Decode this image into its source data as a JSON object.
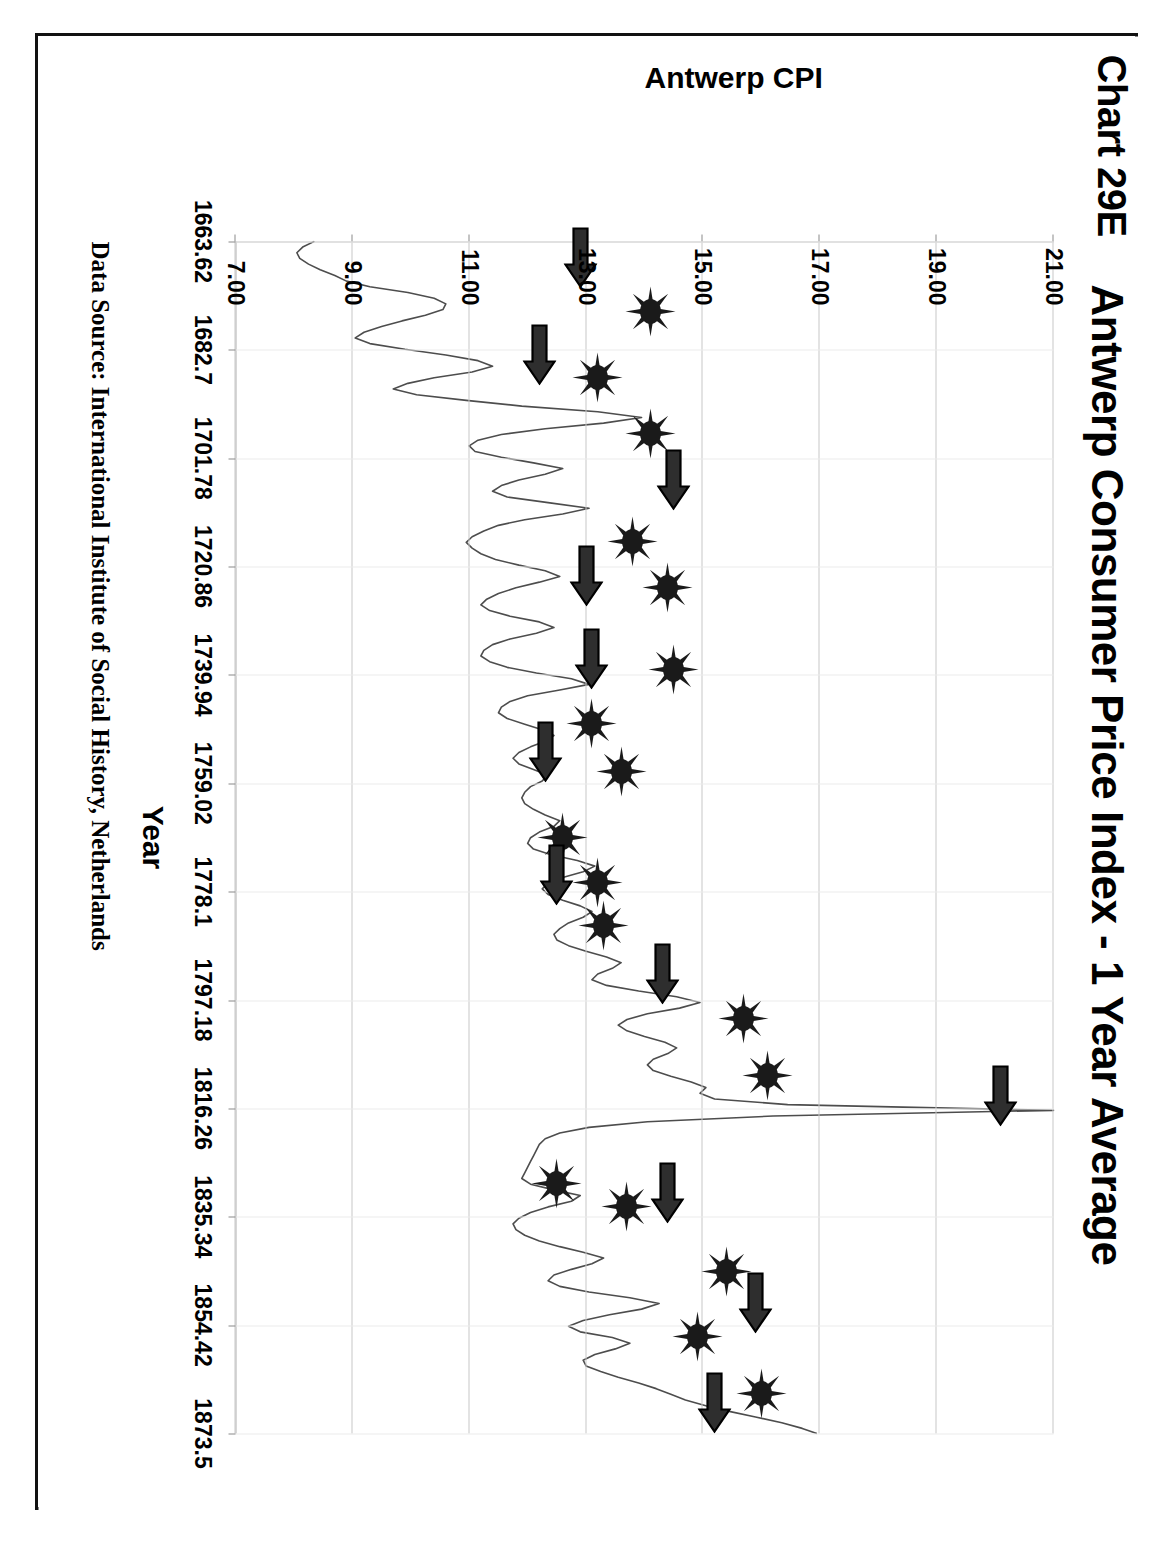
{
  "page": {
    "chart_number": "Chart 29E"
  },
  "chart_data": {
    "type": "line",
    "title": "Antwerp Consumer Price Index - 1 Year Average",
    "xlabel": "Year",
    "ylabel": "Antwerp CPI",
    "source_note": "Data Source:   International Institute of Social History, Netherlands",
    "grid": true,
    "legend": "none",
    "ylim": [
      7.0,
      21.0
    ],
    "xlim": [
      1663.62,
      1873.5
    ],
    "ytick_labels": [
      "21.00",
      "19.00",
      "17.00",
      "15.00",
      "13.00",
      "11.00",
      "9.00",
      "7.00"
    ],
    "ytick_values": [
      21.0,
      19.0,
      17.0,
      15.0,
      13.0,
      11.0,
      9.0,
      7.0
    ],
    "xtick_labels": [
      "1663.62",
      "1682.7",
      "1701.78",
      "1720.86",
      "1739.94",
      "1759.02",
      "1778.1",
      "1797.18",
      "1816.26",
      "1835.34",
      "1854.42",
      "1873.5"
    ],
    "xtick_values": [
      1663.62,
      1682.7,
      1701.78,
      1720.86,
      1739.94,
      1759.02,
      1778.1,
      1797.18,
      1816.26,
      1835.34,
      1854.42,
      1873.5
    ],
    "series": [
      {
        "name": "Antwerp CPI 1 Year Average",
        "x": [
          1663.6,
          1664.6,
          1665.6,
          1666.6,
          1667.6,
          1668.6,
          1669.6,
          1670.6,
          1671.6,
          1672.6,
          1673.6,
          1674.6,
          1675.6,
          1676.6,
          1677.6,
          1678.6,
          1679.6,
          1680.6,
          1681.6,
          1682.6,
          1683.6,
          1684.6,
          1685.6,
          1686.6,
          1687.6,
          1688.6,
          1689.6,
          1690.6,
          1691.6,
          1692.6,
          1693.6,
          1694.6,
          1695.6,
          1696.6,
          1697.6,
          1698.6,
          1699.6,
          1700.6,
          1701.6,
          1702.6,
          1703.6,
          1704.6,
          1705.6,
          1706.6,
          1707.6,
          1708.6,
          1709.6,
          1710.6,
          1711.6,
          1712.6,
          1713.6,
          1714.6,
          1715.6,
          1716.6,
          1717.6,
          1718.6,
          1719.6,
          1720.6,
          1721.6,
          1722.6,
          1723.6,
          1724.6,
          1725.6,
          1726.6,
          1727.6,
          1728.6,
          1729.6,
          1730.6,
          1731.6,
          1732.6,
          1733.6,
          1734.6,
          1735.6,
          1736.6,
          1737.6,
          1738.6,
          1739.6,
          1740.6,
          1741.6,
          1742.6,
          1743.6,
          1744.6,
          1745.6,
          1746.6,
          1747.6,
          1748.6,
          1749.6,
          1750.6,
          1751.6,
          1752.6,
          1753.6,
          1754.6,
          1755.6,
          1756.6,
          1757.6,
          1758.6,
          1759.6,
          1760.6,
          1761.6,
          1762.6,
          1763.6,
          1764.6,
          1765.6,
          1766.6,
          1767.6,
          1768.6,
          1769.6,
          1770.6,
          1771.6,
          1772.6,
          1773.6,
          1774.6,
          1775.6,
          1776.6,
          1777.6,
          1778.6,
          1779.6,
          1780.6,
          1781.6,
          1782.6,
          1783.6,
          1784.6,
          1785.6,
          1786.6,
          1787.6,
          1788.6,
          1789.6,
          1790.6,
          1791.6,
          1792.6,
          1793.6,
          1794.6,
          1795.6,
          1796.6,
          1797.6,
          1798.6,
          1799.6,
          1800.6,
          1801.6,
          1802.6,
          1803.6,
          1804.6,
          1805.6,
          1806.6,
          1807.6,
          1808.6,
          1809.6,
          1810.6,
          1811.6,
          1812.6,
          1813.6,
          1814.6,
          1815.6,
          1816.6,
          1817.6,
          1818.6,
          1819.6,
          1820.6,
          1821.6,
          1822.6,
          1823.6,
          1824.6,
          1825.6,
          1826.6,
          1827.6,
          1828.6,
          1829.6,
          1830.6,
          1831.6,
          1832.6,
          1833.6,
          1834.6,
          1835.6,
          1836.6,
          1837.6,
          1838.6,
          1839.6,
          1840.6,
          1841.6,
          1842.6,
          1843.6,
          1844.6,
          1845.6,
          1846.6,
          1847.6,
          1848.6,
          1849.6,
          1850.6,
          1851.6,
          1852.6,
          1853.6,
          1854.6,
          1855.6,
          1856.6,
          1857.6,
          1858.6,
          1859.6,
          1860.6,
          1861.6,
          1862.6,
          1863.6,
          1864.6,
          1865.6,
          1866.6,
          1867.6,
          1868.6,
          1869.6,
          1870.6,
          1871.6,
          1872.6,
          1873.5
        ],
        "y": [
          8.35,
          8.15,
          8.05,
          8.1,
          8.25,
          8.45,
          8.7,
          8.9,
          9.3,
          9.95,
          10.4,
          10.6,
          10.55,
          10.25,
          9.85,
          9.5,
          9.2,
          9.05,
          9.3,
          9.9,
          10.6,
          11.15,
          11.4,
          11.05,
          10.4,
          9.95,
          9.7,
          10.1,
          10.95,
          11.9,
          13.2,
          13.95,
          13.3,
          12.3,
          11.55,
          11.15,
          11.0,
          11.1,
          11.55,
          12.1,
          12.6,
          12.3,
          11.85,
          11.55,
          11.4,
          11.65,
          12.35,
          13.05,
          12.6,
          11.95,
          11.5,
          11.25,
          11.05,
          10.95,
          11.05,
          11.2,
          11.45,
          11.85,
          12.3,
          12.55,
          12.2,
          11.8,
          11.5,
          11.3,
          11.2,
          11.35,
          11.7,
          12.2,
          12.45,
          12.15,
          11.7,
          11.4,
          11.25,
          11.2,
          11.35,
          11.65,
          12.15,
          12.75,
          13.05,
          12.55,
          12.0,
          11.7,
          11.55,
          11.5,
          11.65,
          11.95,
          12.25,
          12.45,
          12.3,
          12.05,
          11.85,
          11.75,
          11.85,
          12.1,
          12.35,
          12.25,
          12.05,
          11.95,
          11.9,
          11.95,
          12.1,
          12.3,
          12.55,
          12.45,
          12.2,
          12.05,
          12.0,
          12.1,
          12.4,
          12.85,
          13.15,
          12.95,
          12.6,
          12.35,
          12.25,
          12.35,
          12.6,
          12.9,
          13.1,
          12.95,
          12.7,
          12.55,
          12.45,
          12.5,
          12.7,
          13.0,
          13.35,
          13.6,
          13.45,
          13.2,
          13.1,
          13.35,
          13.9,
          14.55,
          14.95,
          14.6,
          14.05,
          13.7,
          13.55,
          13.7,
          14.0,
          14.35,
          14.55,
          14.4,
          14.15,
          14.05,
          14.15,
          14.45,
          14.8,
          15.05,
          14.95,
          15.2,
          16.45,
          21.0,
          16.2,
          14.05,
          13.05,
          12.55,
          12.3,
          12.2,
          12.15,
          12.1,
          12.05,
          12.0,
          11.95,
          11.9,
          12.05,
          12.45,
          12.9,
          12.75,
          12.35,
          12.05,
          11.85,
          11.75,
          11.8,
          11.95,
          12.2,
          12.55,
          12.95,
          13.3,
          13.1,
          12.75,
          12.45,
          12.35,
          12.55,
          13.05,
          13.75,
          14.25,
          13.95,
          13.4,
          12.95,
          12.7,
          12.9,
          13.45,
          13.75,
          13.5,
          13.15,
          12.95,
          13.0,
          13.25,
          13.55,
          13.9,
          14.2,
          14.45,
          14.7,
          15.05,
          15.45,
          15.9,
          16.35,
          16.7,
          16.95
        ]
      }
    ],
    "annotations": {
      "star_label": "sunburst-marker",
      "arrow_label": "block-arrow-marker",
      "marker_color": "#1a1a1a",
      "stars": [
        {
          "x": 1676.0,
          "y": 14.1
        },
        {
          "x": 1687.5,
          "y": 13.2
        },
        {
          "x": 1697.5,
          "y": 14.1
        },
        {
          "x": 1716.5,
          "y": 13.8
        },
        {
          "x": 1724.5,
          "y": 14.4
        },
        {
          "x": 1739.0,
          "y": 14.5
        },
        {
          "x": 1748.5,
          "y": 13.1
        },
        {
          "x": 1757.0,
          "y": 13.6
        },
        {
          "x": 1768.5,
          "y": 12.6
        },
        {
          "x": 1776.5,
          "y": 13.2
        },
        {
          "x": 1784.0,
          "y": 13.3
        },
        {
          "x": 1800.5,
          "y": 15.7
        },
        {
          "x": 1810.5,
          "y": 16.1
        },
        {
          "x": 1829.5,
          "y": 12.5
        },
        {
          "x": 1833.5,
          "y": 13.7
        },
        {
          "x": 1845.0,
          "y": 15.4
        },
        {
          "x": 1856.5,
          "y": 14.9
        },
        {
          "x": 1866.5,
          "y": 16.0
        }
      ],
      "arrows": [
        {
          "x": 1666.5,
          "y": 12.9
        },
        {
          "x": 1683.5,
          "y": 12.2
        },
        {
          "x": 1705.5,
          "y": 14.5
        },
        {
          "x": 1722.5,
          "y": 13.0
        },
        {
          "x": 1737.0,
          "y": 13.1
        },
        {
          "x": 1753.5,
          "y": 12.3
        },
        {
          "x": 1775.0,
          "y": 12.5
        },
        {
          "x": 1792.5,
          "y": 14.3
        },
        {
          "x": 1814.0,
          "y": 20.1
        },
        {
          "x": 1831.0,
          "y": 14.4
        },
        {
          "x": 1850.5,
          "y": 15.9
        },
        {
          "x": 1868.0,
          "y": 15.2
        }
      ]
    }
  }
}
